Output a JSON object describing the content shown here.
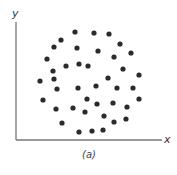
{
  "chart_data": {
    "type": "scatter",
    "title": "",
    "caption": "(a)",
    "xlabel": "x",
    "ylabel": "y",
    "grid": false,
    "legend": null,
    "xlim": [
      0,
      146
    ],
    "ylim": [
      0,
      118
    ],
    "points_pixel_space": {
      "origin": [
        16,
        140
      ],
      "note": "pixel coordinates of dots in the 177x175 image; no numeric ticks shown"
    },
    "points": [
      {
        "x": 75,
        "y": 32
      },
      {
        "x": 94,
        "y": 33
      },
      {
        "x": 109,
        "y": 34
      },
      {
        "x": 61,
        "y": 40
      },
      {
        "x": 120,
        "y": 44
      },
      {
        "x": 54,
        "y": 47
      },
      {
        "x": 77,
        "y": 48
      },
      {
        "x": 98,
        "y": 51
      },
      {
        "x": 131,
        "y": 53
      },
      {
        "x": 114,
        "y": 57
      },
      {
        "x": 47,
        "y": 59
      },
      {
        "x": 79,
        "y": 64
      },
      {
        "x": 66,
        "y": 66
      },
      {
        "x": 88,
        "y": 66
      },
      {
        "x": 123,
        "y": 69
      },
      {
        "x": 53,
        "y": 71
      },
      {
        "x": 139,
        "y": 75
      },
      {
        "x": 108,
        "y": 78
      },
      {
        "x": 54,
        "y": 79
      },
      {
        "x": 40,
        "y": 81
      },
      {
        "x": 96,
        "y": 86
      },
      {
        "x": 57,
        "y": 89
      },
      {
        "x": 78,
        "y": 88
      },
      {
        "x": 117,
        "y": 88
      },
      {
        "x": 133,
        "y": 88
      },
      {
        "x": 43,
        "y": 100
      },
      {
        "x": 87,
        "y": 99
      },
      {
        "x": 139,
        "y": 99
      },
      {
        "x": 113,
        "y": 103
      },
      {
        "x": 97,
        "y": 104
      },
      {
        "x": 127,
        "y": 107
      },
      {
        "x": 73,
        "y": 108
      },
      {
        "x": 56,
        "y": 109
      },
      {
        "x": 85,
        "y": 112
      },
      {
        "x": 104,
        "y": 116
      },
      {
        "x": 126,
        "y": 119
      },
      {
        "x": 114,
        "y": 122
      },
      {
        "x": 62,
        "y": 123
      },
      {
        "x": 103,
        "y": 130
      },
      {
        "x": 92,
        "y": 131
      },
      {
        "x": 79,
        "y": 132
      }
    ]
  },
  "style": {
    "dot_color": "#2b2b2b",
    "axis_color": "#777777",
    "dot_radius": 2.6
  }
}
